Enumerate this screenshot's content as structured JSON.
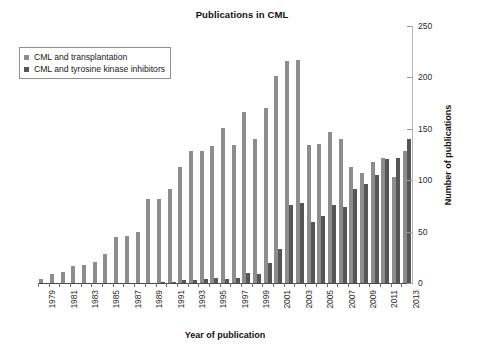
{
  "chart_data": {
    "type": "bar",
    "title": "Publications in CML",
    "xlabel": "Year of publication",
    "ylabel": "Number of publications",
    "ylim": [
      0,
      250
    ],
    "yticks": [
      0,
      50,
      100,
      150,
      200,
      250
    ],
    "grid": false,
    "legend_position": "top-left",
    "categories": [
      "1979",
      "1980",
      "1981",
      "1982",
      "1983",
      "1984",
      "1985",
      "1986",
      "1987",
      "1988",
      "1989",
      "1990",
      "1991",
      "1992",
      "1993",
      "1994",
      "1995",
      "1996",
      "1997",
      "1998",
      "1999",
      "2000",
      "2001",
      "2002",
      "2003",
      "2004",
      "2005",
      "2006",
      "2007",
      "2008",
      "2009",
      "2010",
      "2011",
      "2012",
      "2013"
    ],
    "xtick_labels": [
      "1979",
      "1981",
      "1983",
      "1985",
      "1987",
      "1989",
      "1991",
      "1993",
      "1995",
      "1997",
      "1999",
      "2001",
      "2003",
      "2005",
      "2007",
      "2009",
      "2011",
      "2013"
    ],
    "series": [
      {
        "name": "CML and transplantation",
        "color": "#8d8d8d",
        "values": [
          4,
          9,
          11,
          17,
          18,
          20,
          28,
          45,
          46,
          50,
          82,
          82,
          91,
          113,
          128,
          128,
          133,
          151,
          134,
          166,
          140,
          170,
          201,
          216,
          217,
          134,
          135,
          147,
          140,
          113,
          107,
          118,
          122,
          103,
          128
        ]
      },
      {
        "name": "CML and tyrosine kinase inhibitors",
        "color": "#565656",
        "values": [
          0,
          0,
          0,
          0,
          0,
          0,
          0,
          0,
          0,
          0,
          0,
          1,
          1,
          3,
          3,
          4,
          5,
          4,
          5,
          10,
          9,
          19,
          33,
          76,
          78,
          59,
          65,
          76,
          74,
          91,
          96,
          105,
          121,
          122,
          140
        ]
      }
    ]
  },
  "legend": {
    "items": [
      {
        "label": "CML and transplantation",
        "color": "#8d8d8d"
      },
      {
        "label": "CML and tyrosine kinase inhibitors",
        "color": "#565656"
      }
    ]
  }
}
